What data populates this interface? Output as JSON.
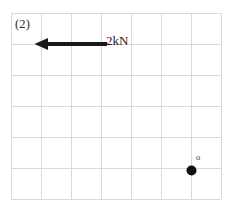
{
  "figure": {
    "panel_label": "(2)",
    "background_color": "#ffffff"
  },
  "grid": {
    "line_color": "#d9d9d9",
    "border_color": "#cccccc",
    "left": 11,
    "top": 13,
    "right": 221,
    "bottom": 199,
    "columns": 7,
    "rows": 6,
    "cell_width": 30,
    "cell_height": 31
  },
  "force_arrow": {
    "label": "2kN",
    "direction": "left",
    "color": "#1a1a1a",
    "tail_x": 106,
    "tip_x": 36,
    "y": 44,
    "shaft_thickness": 4
  },
  "pivot_point": {
    "label": "o",
    "dot_color": "#101010",
    "dot_radius": 5,
    "x": 191,
    "y": 170
  }
}
